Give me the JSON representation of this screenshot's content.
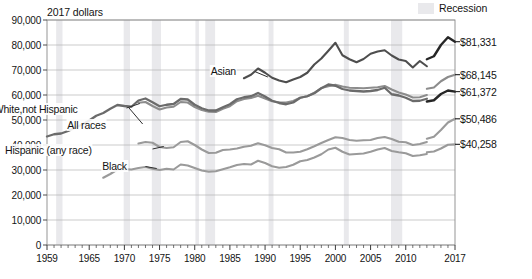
{
  "legend": {
    "recession_label": "Recession",
    "recession_color": "#e9e9ec",
    "swatch_name": "recession-swatch"
  },
  "axis_title": "2017 dollars",
  "chart_data": {
    "type": "line",
    "title": "2017 dollars",
    "xlabel": "",
    "ylabel": "2017 dollars",
    "ylim": [
      0,
      90000
    ],
    "xlim": [
      1959,
      2017
    ],
    "grid": true,
    "legend_position": "top-right",
    "ytick_labels": [
      "90,000",
      "80,000",
      "70,000",
      "60,000",
      "50,000",
      "40,000",
      "30,000",
      "20,000",
      "10,000",
      "0"
    ],
    "ytick_values": [
      90000,
      80000,
      70000,
      60000,
      50000,
      40000,
      30000,
      20000,
      10000,
      0
    ],
    "xtick_labels": [
      "1959",
      "1965",
      "1970",
      "1975",
      "1980",
      "1985",
      "1990",
      "1995",
      "2000",
      "2005",
      "2010",
      "2017"
    ],
    "xtick_values": [
      1959,
      1965,
      1970,
      1975,
      1980,
      1985,
      1990,
      1995,
      2000,
      2005,
      2010,
      2017
    ],
    "annotations": [
      {
        "text": "Asian",
        "x": 1986,
        "y": 69500
      },
      {
        "text": "White,not Hispanic",
        "x": 1963.5,
        "y": 54500
      },
      {
        "text": "All races",
        "x": 1967.5,
        "y": 48200
      },
      {
        "text": "Hispanic (any race)",
        "x": 1965.5,
        "y": 38200
      },
      {
        "text": "Black",
        "x": 1970.5,
        "y": 31600
      }
    ],
    "end_labels": [
      {
        "text": "$81,331",
        "value": 81331,
        "series": "Asian"
      },
      {
        "text": "$68,145",
        "value": 68145,
        "series": "White, not Hispanic"
      },
      {
        "text": "$61,372",
        "value": 61372,
        "series": "All races"
      },
      {
        "text": "$50,486",
        "value": 50486,
        "series": "Hispanic (any race)"
      },
      {
        "text": "$40,258",
        "value": 40258,
        "series": "Black"
      }
    ],
    "recession_bands": [
      [
        1960.3,
        1961.2
      ],
      [
        1969.9,
        1970.8
      ],
      [
        1973.9,
        1975.2
      ],
      [
        1980.1,
        1980.6
      ],
      [
        1981.5,
        1982.9
      ],
      [
        1990.5,
        1991.2
      ],
      [
        2001.2,
        2001.9
      ],
      [
        2007.9,
        2009.5
      ]
    ],
    "series": [
      {
        "name": "Asian",
        "color": "#4e4e4e",
        "width": 2.1,
        "x": [
          1987,
          1988,
          1989,
          1990,
          1991,
          1992,
          1993,
          1994,
          1995,
          1996,
          1997,
          1998,
          1999,
          2000,
          2001,
          2002,
          2003,
          2004,
          2005,
          2006,
          2007,
          2008,
          2009,
          2010,
          2011,
          2012,
          2013
        ],
        "values": [
          66700,
          68100,
          70600,
          68900,
          66900,
          65800,
          65100,
          66200,
          67200,
          68900,
          72200,
          74600,
          77700,
          80900,
          75900,
          74300,
          73100,
          74400,
          76500,
          77400,
          77900,
          75800,
          74200,
          73600,
          71000,
          73600,
          71500
        ]
      },
      {
        "name": "Asian-new",
        "color": "#262626",
        "width": 2.4,
        "x": [
          2013,
          2014,
          2015,
          2016,
          2017
        ],
        "values": [
          74300,
          75500,
          80000,
          83100,
          81331
        ]
      },
      {
        "name": "White, not Hispanic",
        "color": "#8c8c8c",
        "width": 2.1,
        "x": [
          1972,
          1973,
          1974,
          1975,
          1976,
          1977,
          1978,
          1979,
          1980,
          1981,
          1982,
          1983,
          1984,
          1985,
          1986,
          1987,
          1988,
          1989,
          1990,
          1991,
          1992,
          1993,
          1994,
          1995,
          1996,
          1997,
          1998,
          1999,
          2000,
          2001,
          2002,
          2003,
          2004,
          2005,
          2006,
          2007,
          2008,
          2009,
          2010,
          2011,
          2012,
          2013
        ],
        "values": [
          56900,
          57200,
          55600,
          54200,
          55000,
          55300,
          57200,
          57000,
          55200,
          54000,
          53300,
          53200,
          54500,
          55500,
          57500,
          58400,
          58800,
          59700,
          58600,
          57500,
          57100,
          57000,
          57600,
          58900,
          59500,
          60900,
          62800,
          63500,
          64100,
          63400,
          62900,
          62800,
          62700,
          62900,
          63100,
          63600,
          62200,
          61000,
          60200,
          59000,
          59100,
          60000
        ]
      },
      {
        "name": "White-new",
        "color": "#8c8c8c",
        "width": 2.1,
        "x": [
          2013,
          2014,
          2015,
          2016,
          2017
        ],
        "values": [
          62500,
          63000,
          65500,
          67200,
          68145
        ]
      },
      {
        "name": "All races",
        "color": "#6b6b6b",
        "width": 2.3,
        "x": [
          1959,
          1960,
          1961,
          1962,
          1963,
          1964,
          1965,
          1966,
          1967,
          1968,
          1969,
          1970,
          1971,
          1972,
          1973,
          1974,
          1975,
          1976,
          1977,
          1978,
          1979,
          1980,
          1981,
          1982,
          1983,
          1984,
          1985,
          1986,
          1987,
          1988,
          1989,
          1990,
          1991,
          1992,
          1993,
          1994,
          1995,
          1996,
          1997,
          1998,
          1999,
          2000,
          2001,
          2002,
          2003,
          2004,
          2005,
          2006,
          2007,
          2008,
          2009,
          2010,
          2011,
          2012,
          2013
        ],
        "values": [
          43400,
          44300,
          44600,
          45600,
          46900,
          48200,
          49800,
          51700,
          52800,
          54500,
          56000,
          55600,
          55300,
          57800,
          58600,
          57100,
          55500,
          56100,
          56400,
          58400,
          58200,
          56100,
          54700,
          53800,
          53800,
          55100,
          56300,
          58300,
          59100,
          59500,
          60800,
          59400,
          57700,
          56800,
          56300,
          57000,
          58900,
          59500,
          60700,
          62700,
          64200,
          63700,
          62400,
          61800,
          61600,
          61400,
          61600,
          62000,
          62900,
          60300,
          59800,
          58900,
          57600,
          57700,
          58500
        ]
      },
      {
        "name": "All-races-new",
        "color": "#262626",
        "width": 2.4,
        "x": [
          2013,
          2014,
          2015,
          2016,
          2017
        ],
        "values": [
          57400,
          57900,
          60400,
          61800,
          61372
        ]
      },
      {
        "name": "Hispanic (any race)",
        "color": "#9a9a9a",
        "width": 2.1,
        "x": [
          1972,
          1973,
          1974,
          1975,
          1976,
          1977,
          1978,
          1979,
          1980,
          1981,
          1982,
          1983,
          1984,
          1985,
          1986,
          1987,
          1988,
          1989,
          1990,
          1991,
          1992,
          1993,
          1994,
          1995,
          1996,
          1997,
          1998,
          1999,
          2000,
          2001,
          2002,
          2003,
          2004,
          2005,
          2006,
          2007,
          2008,
          2009,
          2010,
          2011,
          2012,
          2013
        ],
        "values": [
          40600,
          41200,
          40900,
          39200,
          38800,
          39100,
          41200,
          41500,
          40000,
          38200,
          36800,
          36900,
          38000,
          38200,
          38600,
          39300,
          39700,
          40700,
          39900,
          38800,
          38300,
          37000,
          37000,
          37300,
          38300,
          39500,
          40800,
          42000,
          43100,
          42800,
          42000,
          41700,
          41900,
          42000,
          42800,
          43200,
          42400,
          41300,
          41100,
          40000,
          40400,
          41200
        ]
      },
      {
        "name": "Hispanic-new",
        "color": "#9a9a9a",
        "width": 2.1,
        "x": [
          2013,
          2014,
          2015,
          2016,
          2017
        ],
        "values": [
          42500,
          43300,
          46000,
          49000,
          50486
        ]
      },
      {
        "name": "Black",
        "color": "#9a9a9a",
        "width": 2.1,
        "x": [
          1967,
          1968,
          1969,
          1970,
          1971,
          1972,
          1973,
          1974,
          1975,
          1976,
          1977,
          1978,
          1979,
          1980,
          1981,
          1982,
          1983,
          1984,
          1985,
          1986,
          1987,
          1988,
          1989,
          1990,
          1991,
          1992,
          1993,
          1994,
          1995,
          1996,
          1997,
          1998,
          1999,
          2000,
          2001,
          2002,
          2003,
          2004,
          2005,
          2006,
          2007,
          2008,
          2009,
          2010,
          2011,
          2012,
          2013
        ],
        "values": [
          26900,
          28400,
          30200,
          30400,
          30200,
          30800,
          31200,
          30500,
          30000,
          30500,
          30200,
          32200,
          31800,
          30800,
          29800,
          29300,
          29500,
          30300,
          31100,
          32000,
          32400,
          32200,
          33700,
          32800,
          31500,
          30900,
          31200,
          32100,
          33500,
          34000,
          35000,
          36300,
          38200,
          38900,
          37300,
          36200,
          36400,
          36600,
          37300,
          38200,
          38800,
          37600,
          37100,
          36700,
          35600,
          35900,
          36400
        ]
      },
      {
        "name": "Black-new",
        "color": "#9a9a9a",
        "width": 2.1,
        "x": [
          2013,
          2014,
          2015,
          2016,
          2017
        ],
        "values": [
          37100,
          37400,
          38600,
          40100,
          40258
        ]
      }
    ]
  }
}
